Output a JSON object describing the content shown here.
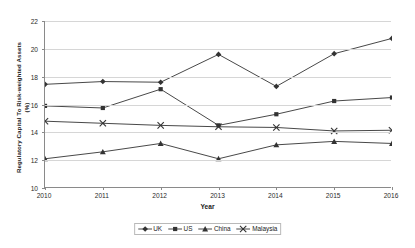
{
  "chart_data": {
    "type": "line",
    "title": "",
    "xlabel": "Year",
    "ylabel": "Regulatory Capital To Risk-weighted Assets",
    "ylabel_unit": "(%)",
    "categories": [
      "2010",
      "2011",
      "2012",
      "2013",
      "2014",
      "2015",
      "2016"
    ],
    "x": [
      2010,
      2011,
      2012,
      2013,
      2014,
      2015,
      2016
    ],
    "ylim": [
      10,
      22
    ],
    "xlim": [
      2010,
      2016
    ],
    "yticks": [
      10,
      12,
      14,
      16,
      18,
      20,
      22
    ],
    "grid": true,
    "legend_position": "bottom",
    "series": [
      {
        "name": "UK",
        "marker": "diamond",
        "color": "#333333",
        "values": [
          17.45,
          17.65,
          17.6,
          19.6,
          17.3,
          19.65,
          20.75
        ]
      },
      {
        "name": "US",
        "marker": "square",
        "color": "#333333",
        "values": [
          15.9,
          15.75,
          17.1,
          14.5,
          15.3,
          16.25,
          16.5
        ]
      },
      {
        "name": "China",
        "marker": "triangle",
        "color": "#333333",
        "values": [
          12.1,
          12.6,
          13.2,
          12.1,
          13.1,
          13.35,
          13.2
        ]
      },
      {
        "name": "Malaysia",
        "marker": "cross",
        "color": "#333333",
        "values": [
          14.8,
          14.65,
          14.5,
          14.4,
          14.35,
          14.1,
          14.15
        ]
      }
    ]
  }
}
